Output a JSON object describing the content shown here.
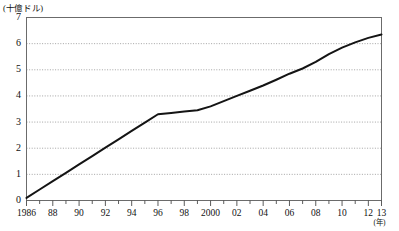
{
  "chart_data": {
    "type": "line",
    "title": "",
    "subtitle": "",
    "xlabel": "(年)",
    "ylabel": "(十億ドル)",
    "xlim": [
      1986,
      2013
    ],
    "ylim": [
      0,
      7
    ],
    "grid": true,
    "grid_style": "dotted-horizontal",
    "legend": false,
    "legend_position": "none",
    "series": [
      {
        "name": "",
        "color": "#141414",
        "x": [
          1986,
          1987,
          1988,
          1989,
          1990,
          1991,
          1992,
          1993,
          1994,
          1995,
          1996,
          1997,
          1998,
          1999,
          2000,
          2001,
          2002,
          2003,
          2004,
          2005,
          2006,
          2007,
          2008,
          2009,
          2010,
          2011,
          2012,
          2013
        ],
        "values": [
          0.1,
          0.42,
          0.74,
          1.06,
          1.38,
          1.7,
          2.02,
          2.34,
          2.66,
          2.98,
          3.3,
          3.35,
          3.4,
          3.45,
          3.6,
          3.8,
          4.0,
          4.2,
          4.4,
          4.62,
          4.85,
          5.05,
          5.3,
          5.6,
          5.85,
          6.05,
          6.22,
          6.35
        ]
      }
    ],
    "y_ticks": [
      0,
      1,
      2,
      3,
      4,
      5,
      6,
      7
    ],
    "y_tick_labels": [
      "0",
      "1",
      "2",
      "3",
      "4",
      "5",
      "6",
      "7"
    ],
    "x_tick_years": [
      1986,
      1987,
      1988,
      1989,
      1990,
      1991,
      1992,
      1993,
      1994,
      1995,
      1996,
      1997,
      1998,
      1999,
      2000,
      2001,
      2002,
      2003,
      2004,
      2005,
      2006,
      2007,
      2008,
      2009,
      2010,
      2011,
      2012,
      2013
    ],
    "x_labeled": [
      {
        "year": 1986,
        "label": "1986"
      },
      {
        "year": 1988,
        "label": "88"
      },
      {
        "year": 1990,
        "label": "90"
      },
      {
        "year": 1992,
        "label": "92"
      },
      {
        "year": 1994,
        "label": "94"
      },
      {
        "year": 1996,
        "label": "96"
      },
      {
        "year": 1998,
        "label": "98"
      },
      {
        "year": 2000,
        "label": "2000"
      },
      {
        "year": 2002,
        "label": "02"
      },
      {
        "year": 2004,
        "label": "04"
      },
      {
        "year": 2006,
        "label": "06"
      },
      {
        "year": 2008,
        "label": "08"
      },
      {
        "year": 2010,
        "label": "10"
      },
      {
        "year": 2012,
        "label": "12"
      },
      {
        "year": 2013,
        "label": "13"
      }
    ]
  },
  "colors": {
    "line": "#141414",
    "frame": "#6b6b6b",
    "grid": "#9a9a9a",
    "text": "#111111",
    "background": "#ffffff"
  }
}
